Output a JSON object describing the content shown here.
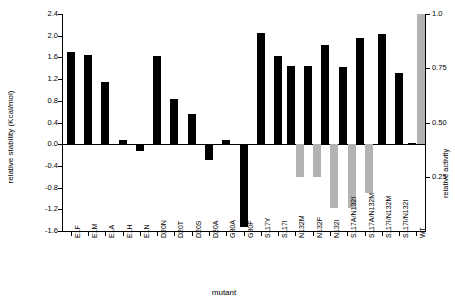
{
  "chart_data": {
    "type": "bar",
    "title": "",
    "xlabel": "mutant",
    "ylabel": "relative stability (Kcal/mol)",
    "ylabel_right": "relative activity",
    "ylim": [
      -1.6,
      2.4
    ],
    "yticks": [
      "-1.6",
      "-1.2",
      "-0.8",
      "-0.4",
      "0.0",
      "0.4",
      "0.8",
      "1.2",
      "1.6",
      "2.0",
      "2.4"
    ],
    "ylim_right": [
      0,
      1.0
    ],
    "yticks_right": [
      "0.25",
      "0.50",
      "0.75",
      "1.0"
    ],
    "grid": false,
    "legend": "none",
    "categories": [
      "E1F",
      "E1M",
      "E1A",
      "E1H",
      "E1N",
      "D20N",
      "D20T",
      "D20S",
      "D20A",
      "G30A",
      "G30F",
      "S117Y",
      "S117I",
      "N132M",
      "N132F",
      "N132I",
      "S117A/N132I",
      "S117A/N132M",
      "S117I/N132M",
      "S117I/N132I",
      "WT"
    ],
    "series": [
      {
        "name": "relative stability (Kcal/mol)",
        "color": "#000000",
        "values": [
          1.7,
          1.64,
          1.14,
          0.07,
          -0.12,
          1.63,
          0.84,
          0.56,
          -0.3,
          0.08,
          -1.52,
          2.05,
          1.63,
          1.45,
          1.45,
          1.82,
          1.42,
          1.96,
          2.04,
          1.32,
          0.03
        ]
      },
      {
        "name": "relative activity",
        "color": "#b3b3b3",
        "values": [
          null,
          null,
          null,
          null,
          null,
          null,
          null,
          null,
          null,
          null,
          null,
          null,
          null,
          0.25,
          0.25,
          0.105,
          0.105,
          0.175,
          null,
          null,
          1.0
        ]
      }
    ]
  }
}
